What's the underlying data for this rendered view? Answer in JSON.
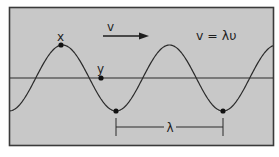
{
  "diagram": {
    "colors": {
      "background": "#c8c8c8",
      "border": "#3a3a3a",
      "line": "#2a2a2a",
      "page": "#ffffff"
    },
    "labels": {
      "point_x": "x",
      "point_y": "y",
      "velocity": "v",
      "equation": "v = λυ",
      "wavelength": "λ"
    },
    "points": [
      {
        "name": "x",
        "description": "crest point",
        "cx": 61,
        "cy": 45
      },
      {
        "name": "y",
        "description": "point on equilibrium line",
        "cx": 101,
        "cy": 78
      },
      {
        "name": "trough-1",
        "description": "first trough",
        "cx": 116,
        "cy": 111
      },
      {
        "name": "trough-2",
        "description": "second trough",
        "cx": 223,
        "cy": 111
      }
    ],
    "wave": {
      "axis_y": 78,
      "amplitude_px": 33,
      "period_px": 107,
      "trough_x": 116,
      "x_start": 10,
      "x_end": 273
    }
  }
}
